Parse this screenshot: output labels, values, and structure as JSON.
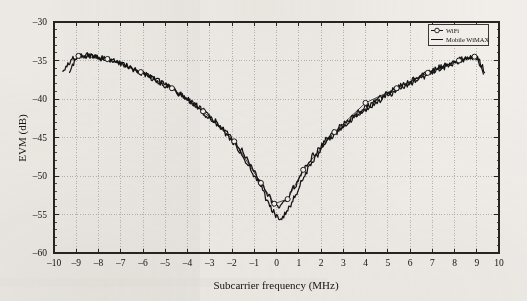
{
  "chart_data": {
    "type": "line",
    "title": "",
    "xlabel": "Subcarrier frequency (MHz)",
    "ylabel": "EVM (dB)",
    "xlim": [
      -10,
      10
    ],
    "ylim": [
      -60,
      -30
    ],
    "xticks": [
      -10,
      -9,
      -8,
      -7,
      -6,
      -5,
      -4,
      -3,
      -2,
      -1,
      0,
      1,
      2,
      3,
      4,
      5,
      6,
      7,
      8,
      9,
      10
    ],
    "xtick_labels": [
      "-10",
      "-9",
      "-8",
      "-7",
      "-6",
      "-5",
      "-4",
      "-3",
      "-2",
      "-1",
      "0",
      "1",
      "2",
      "3",
      "4",
      "5",
      "6",
      "7",
      "8",
      "9",
      "10"
    ],
    "yticks": [
      -60,
      -55,
      -50,
      -45,
      -40,
      -35,
      -30
    ],
    "ytick_labels": [
      "-60",
      "-55",
      "-50",
      "-45",
      "-40",
      "-35",
      "-30"
    ],
    "y_minor_tick_step": 1,
    "grid": true,
    "grid_style": "dotted",
    "grid_color": "#9a9894",
    "legend_position": "top-right",
    "series": [
      {
        "name": "WiFi",
        "marker": "circle-open",
        "line": "solid",
        "color": "#141414",
        "x": [
          -9.3,
          -9.2,
          -9.0,
          -8.8,
          -8.5,
          -8.2,
          -7.9,
          -7.6,
          -7.3,
          -7.0,
          -6.7,
          -6.4,
          -6.1,
          -5.8,
          -5.5,
          -5.2,
          -4.9,
          -4.6,
          -4.3,
          -4.0,
          -3.7,
          -3.4,
          -3.1,
          -2.8,
          -2.5,
          -2.2,
          -1.9,
          -1.6,
          -1.3,
          -1.0,
          -0.7,
          -0.4,
          -0.1,
          0.2,
          0.5,
          0.8,
          1.1,
          1.4,
          1.7,
          2.0,
          2.3,
          2.6,
          2.9,
          3.2,
          3.5,
          3.8,
          4.1,
          4.4,
          4.7,
          5.0,
          5.3,
          5.6,
          5.9,
          6.2,
          6.5,
          6.8,
          7.1,
          7.4,
          7.7,
          8.0,
          8.3,
          8.6,
          8.8,
          9.0,
          9.2,
          9.3
        ],
        "y": [
          -36.4,
          -35.6,
          -34.9,
          -34.4,
          -34.3,
          -34.4,
          -34.6,
          -34.8,
          -35.1,
          -35.4,
          -35.7,
          -36.1,
          -36.5,
          -36.9,
          -37.3,
          -37.8,
          -38.3,
          -38.8,
          -39.4,
          -40.0,
          -40.6,
          -41.3,
          -42.0,
          -42.8,
          -43.6,
          -44.5,
          -45.5,
          -46.6,
          -47.9,
          -49.4,
          -50.9,
          -52.4,
          -53.6,
          -53.9,
          -53.0,
          -51.4,
          -49.8,
          -48.4,
          -47.2,
          -46.1,
          -45.1,
          -44.3,
          -43.5,
          -42.8,
          -42.1,
          -41.5,
          -40.9,
          -40.4,
          -39.8,
          -39.3,
          -38.8,
          -38.3,
          -37.9,
          -37.4,
          -37.0,
          -36.6,
          -36.2,
          -35.8,
          -35.4,
          -35.1,
          -34.8,
          -34.6,
          -34.5,
          -35.0,
          -35.9,
          -36.5
        ],
        "marker_x": [
          -8.9,
          -7.6,
          -6.1,
          -4.7,
          -3.3,
          -1.9,
          -0.7,
          -0.1,
          0.5,
          1.2,
          2.6,
          4.0,
          5.4,
          6.8,
          8.2,
          8.9
        ],
        "marker_y": [
          -34.4,
          -34.8,
          -36.5,
          -38.6,
          -41.6,
          -45.5,
          -50.9,
          -53.6,
          -53.0,
          -49.2,
          -44.3,
          -40.5,
          -38.6,
          -36.6,
          -35.0,
          -34.5
        ]
      },
      {
        "name": "Mobile WiMAX",
        "marker": "none",
        "line": "solid",
        "color": "#141414",
        "x": [
          -9.6,
          -9.45,
          -9.3,
          -9.15,
          -9.0,
          -8.8,
          -8.5,
          -8.2,
          -7.9,
          -7.6,
          -7.3,
          -7.0,
          -6.7,
          -6.4,
          -6.1,
          -5.8,
          -5.5,
          -5.2,
          -4.9,
          -4.6,
          -4.3,
          -4.0,
          -3.7,
          -3.4,
          -3.1,
          -2.8,
          -2.5,
          -2.2,
          -1.9,
          -1.6,
          -1.3,
          -1.0,
          -0.7,
          -0.4,
          -0.2,
          0.0,
          0.2,
          0.4,
          0.6,
          0.9,
          1.2,
          1.5,
          1.8,
          2.1,
          2.4,
          2.7,
          3.0,
          3.3,
          3.6,
          3.9,
          4.2,
          4.5,
          4.8,
          5.1,
          5.4,
          5.7,
          6.0,
          6.3,
          6.6,
          6.9,
          7.2,
          7.5,
          7.8,
          8.1,
          8.4,
          8.7,
          8.9,
          9.1,
          9.25,
          9.35
        ],
        "y": [
          -36.6,
          -35.9,
          -35.2,
          -34.8,
          -34.6,
          -34.4,
          -34.4,
          -34.5,
          -34.7,
          -34.9,
          -35.2,
          -35.5,
          -35.8,
          -36.2,
          -36.6,
          -37.0,
          -37.4,
          -37.9,
          -38.4,
          -38.9,
          -39.5,
          -40.1,
          -40.8,
          -41.5,
          -42.2,
          -43.0,
          -43.9,
          -44.8,
          -45.8,
          -47.0,
          -48.3,
          -49.8,
          -51.4,
          -53.2,
          -54.4,
          -55.2,
          -55.5,
          -55.0,
          -54.0,
          -52.2,
          -50.3,
          -48.7,
          -47.4,
          -46.2,
          -45.2,
          -44.4,
          -43.6,
          -42.9,
          -42.2,
          -41.6,
          -41.0,
          -40.5,
          -39.9,
          -39.4,
          -38.9,
          -38.4,
          -38.0,
          -37.5,
          -37.1,
          -36.7,
          -36.3,
          -35.9,
          -35.5,
          -35.2,
          -34.9,
          -34.6,
          -34.5,
          -34.9,
          -35.8,
          -36.6
        ]
      }
    ],
    "noise_amplitude_db": 0.35,
    "annotations": []
  },
  "legend": {
    "entries": [
      {
        "label": "WiFi",
        "symbol": "circle-open-with-line"
      },
      {
        "label": "Mobile WiMAX",
        "symbol": "line"
      }
    ]
  }
}
